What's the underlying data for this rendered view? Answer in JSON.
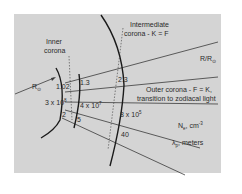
{
  "diagram": {
    "type": "corona-region-diagram",
    "colors": {
      "panel_background": "#d4d4d4",
      "line": "#3a3a3a",
      "arc": "#1a1a1a",
      "text": "#2a2a2a"
    },
    "region_labels": {
      "inner_corona_line1": "Inner",
      "inner_corona_line2": "corona",
      "intermediate_line1": "Intermediate",
      "intermediate_line2": "corona - K = F",
      "outer_line1": "Outer corona - F = K,",
      "outer_line2": "transition to zodiacal light"
    },
    "axis_labels": {
      "r_solar": "R",
      "r_solar_sub": "⊙",
      "radius_ratio": "R/R",
      "radius_ratio_sub": "⊙",
      "electron_density": "N",
      "electron_density_sub": "e",
      "electron_density_unit": ", cm",
      "electron_density_exp": "-3",
      "wavelength": "λ",
      "wavelength_sub": "p",
      "wavelength_unit": ", meters"
    },
    "values": {
      "radius_1": "1.02",
      "radius_2": "1.3",
      "radius_3": "2.3",
      "density_1": "3 x 10",
      "density_1_exp": "8",
      "density_2": "4 x 10",
      "density_2_exp": "7",
      "density_3": "8 x 10",
      "density_3_exp": "5",
      "wavelength_1": "2",
      "wavelength_2": "5",
      "wavelength_3": "40"
    }
  }
}
